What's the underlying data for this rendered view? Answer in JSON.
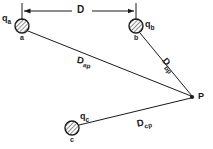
{
  "figure": {
    "background_color": "#ffffff",
    "stroke_color": "#1a1a1a"
  },
  "dimension": {
    "label": "D",
    "description": "horizontal separation between charge a and charge b",
    "left_tick_x": 22,
    "right_tick_x": 136,
    "line_y": 11
  },
  "charges": [
    {
      "id": "a",
      "charge_label": "q",
      "charge_subscript": "a",
      "node_label": "a",
      "cx": 22,
      "cy": 26,
      "r": 7,
      "hatched": true
    },
    {
      "id": "b",
      "charge_label": "q",
      "charge_subscript": "b",
      "node_label": "b",
      "cx": 136,
      "cy": 26,
      "r": 7,
      "hatched": true
    },
    {
      "id": "c",
      "charge_label": "q",
      "charge_subscript": "c",
      "node_label": "c",
      "cx": 72,
      "cy": 128,
      "r": 7,
      "hatched": true
    }
  ],
  "field_point": {
    "label": "P",
    "x": 192,
    "y": 97
  },
  "distances": [
    {
      "id": "Dap",
      "label": "D",
      "subscript": "ap",
      "from": "a",
      "to": "P"
    },
    {
      "id": "Dbp",
      "label": "D",
      "subscript": "bp",
      "from": "b",
      "to": "P"
    },
    {
      "id": "Dcp",
      "label": "D",
      "subscript": "cp",
      "from": "c",
      "to": "P"
    }
  ]
}
